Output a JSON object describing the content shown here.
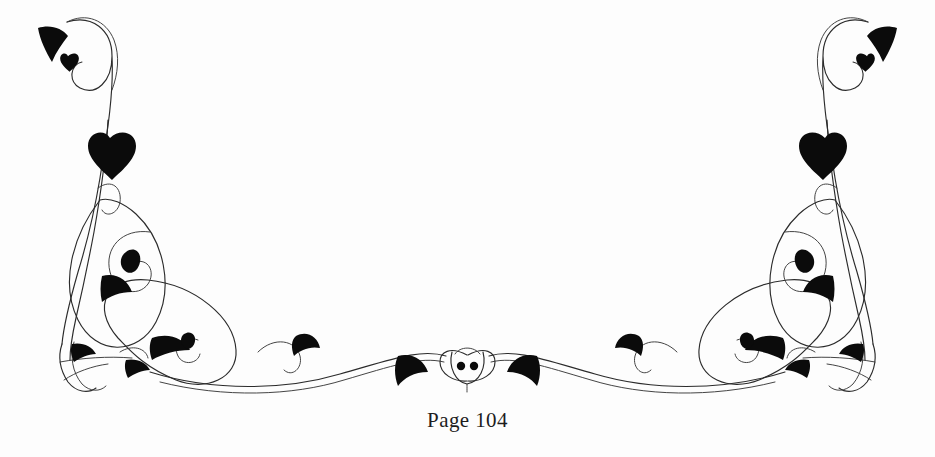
{
  "page": {
    "width": 935,
    "height": 457,
    "background_color": "#fdfdfd",
    "ink_color": "#0b0b0b",
    "stroke_color": "#2b2b2b"
  },
  "footer": {
    "page_number_text": "Page 104",
    "page_label": "Page",
    "page_value": "104"
  },
  "ornament": {
    "name": "symmetric-floral-flourish",
    "description": "Mirrored calligraphic vine flourish with solid black leaf accents spanning the page footer",
    "symmetry": "horizontal-mirror-about-center",
    "center_medallion_dots": 2,
    "leaf_count_per_side": 9
  }
}
